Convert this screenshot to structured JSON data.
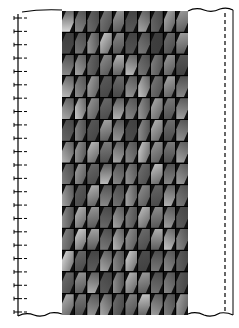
{
  "figure": {
    "grid": {
      "columns": 10,
      "rows": 14
    },
    "left_ruler": {
      "tick_count": 23
    },
    "tile_shades": [
      "#d8d8d8",
      "#8a8a8a",
      "#6e6e6e",
      "#7a7a7a",
      "#9a9a9a",
      "#5a5a5a",
      "#a8a8a8",
      "#666",
      "#b0b0b0",
      "#9e9e9e",
      "#4a4a4a",
      "#777",
      "#999",
      "#cfcfcf",
      "#888",
      "#555",
      "#7c7c7c",
      "#3f3f3f",
      "#707070",
      "#a0a0a0",
      "#8c8c8c",
      "#a5a5a5",
      "#6a6a6a",
      "#909090",
      "#b5b5b5",
      "#c0c0c0",
      "#777",
      "#808080",
      "#9a9a9a",
      "#555",
      "#bdbdbd",
      "#8e8e8e",
      "#a8a8a8",
      "#5c5c5c",
      "#6b6b6b",
      "#999",
      "#c4c4c4",
      "#7a7a7a",
      "#aaa",
      "#888",
      "#aaa",
      "#c8c8c8",
      "#9c9c9c",
      "#6c6c6c",
      "#b2b2b2",
      "#8a8a8a",
      "#999",
      "#b0b0b0",
      "#7c7c7c",
      "#a2a2a2",
      "#666",
      "#848484",
      "#5a5a5a",
      "#a6a6a6",
      "#999",
      "#4e4e4e",
      "#8f8f8f",
      "#b8b8b8",
      "#6f6f6f",
      "#949494",
      "#b4b4b4",
      "#9a9a9a",
      "#c0c0c0",
      "#7e7e7e",
      "#aaa",
      "#8a8a8a",
      "#d0d0d0",
      "#999",
      "#7a7a7a",
      "#a8a8a8",
      "#7c7c7c",
      "#a0a0a0",
      "#6a6a6a",
      "#bcbcbc",
      "#888",
      "#959595",
      "#707070",
      "#c6c6c6",
      "#858585",
      "#9e9e9e",
      "#a2a2a2",
      "#5e5e5e",
      "#b6b6b6",
      "#8a8a8a",
      "#727272",
      "#a8a8a8",
      "#919191",
      "#666",
      "#b3b3b3",
      "#7d7d7d",
      "#8b8b8b",
      "#bcbcbc",
      "#999",
      "#6a6a6a",
      "#a6a6a6",
      "#808080",
      "#c2c2c2",
      "#8f8f8f",
      "#a0a0a0",
      "#5c5c5c",
      "#888",
      "#d4d4d4",
      "#a4a4a4",
      "#7a7a7a",
      "#b8b8b8",
      "#999",
      "#6e6e6e",
      "#aeaeae",
      "#c6c6c6",
      "#8c8c8c",
      "#e0e0e0",
      "#6a6a6a",
      "#5c5c5c",
      "#a6a6a6",
      "#8a8a8a",
      "#d8d8d8",
      "#4e4e4e",
      "#777",
      "#8d8d8d",
      "#626262",
      "#707070",
      "#9a9a9a",
      "#b0b0b0",
      "#5a5a5a",
      "#8e8e8e",
      "#c4c4c4",
      "#a0a0a0",
      "#727272",
      "#888",
      "#5e5e5e",
      "#b6b6b6",
      "#7a7a7a",
      "#969696",
      "#a8a8a8",
      "#6c6c6c",
      "#8a8a8a",
      "#c8c8c8",
      "#9e9e9e",
      "#7e7e7e",
      "#aaa"
    ]
  }
}
